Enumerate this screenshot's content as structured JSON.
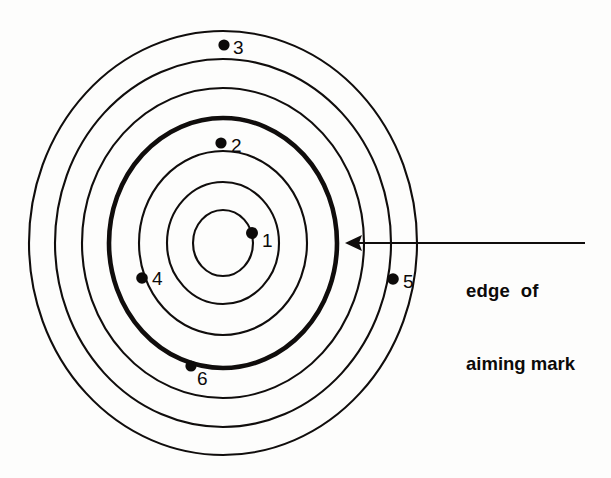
{
  "figure": {
    "name": "concentric-ring-target-with-shot-marks",
    "background_color": "#fdfdfc",
    "ink_color": "#100d0c"
  },
  "target": {
    "center": {
      "x": 223,
      "y": 243
    },
    "ring_count": 6,
    "aiming_mark_ring_index": 3,
    "rings": [
      {
        "index": 0,
        "rx": 194,
        "ry": 212,
        "weight": "thin",
        "name": "ring-outer-1"
      },
      {
        "index": 1,
        "rx": 168,
        "ry": 184,
        "weight": "thin",
        "name": "ring-outer-2"
      },
      {
        "index": 2,
        "rx": 141,
        "ry": 155,
        "weight": "thin",
        "name": "ring-outer-3"
      },
      {
        "index": 3,
        "rx": 114,
        "ry": 125,
        "weight": "thick",
        "name": "ring-aiming-mark-edge"
      },
      {
        "index": 4,
        "rx": 84,
        "ry": 92,
        "weight": "thin",
        "name": "ring-inner-2"
      },
      {
        "index": 5,
        "rx": 56,
        "ry": 61,
        "weight": "thin",
        "name": "ring-inner-1"
      },
      {
        "index": 6,
        "rx": 30,
        "ry": 33,
        "weight": "thin",
        "name": "ring-bullseye"
      }
    ]
  },
  "shots": [
    {
      "label": "1",
      "x": 252,
      "y": 233,
      "r": 6.0,
      "label_x": 262,
      "label_y": 247
    },
    {
      "label": "2",
      "x": 221,
      "y": 143,
      "r": 5.6,
      "label_x": 231,
      "label_y": 152
    },
    {
      "label": "3",
      "x": 224,
      "y": 45,
      "r": 5.6,
      "label_x": 233,
      "label_y": 54
    },
    {
      "label": "4",
      "x": 142,
      "y": 278,
      "r": 5.8,
      "label_x": 152,
      "label_y": 285
    },
    {
      "label": "5",
      "x": 393,
      "y": 279,
      "r": 5.8,
      "label_x": 403,
      "label_y": 288
    },
    {
      "label": "6",
      "x": 191,
      "y": 366,
      "r": 5.6,
      "label_x": 197,
      "label_y": 385
    }
  ],
  "annotation": {
    "line1": "edge  of",
    "line2": "aiming mark",
    "arrow": {
      "tail_x": 585,
      "tail_y": 243,
      "tip_x": 345,
      "tip_y": 243
    }
  }
}
